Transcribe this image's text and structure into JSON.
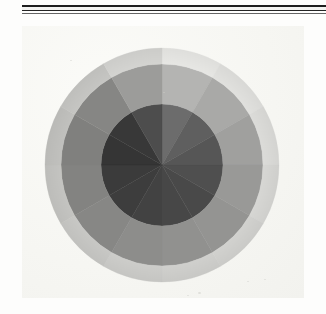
{
  "page": {
    "kind": "printed-plate",
    "background_color": "#fdfdfc",
    "paper_color": "#f5f5f1",
    "width": 326,
    "height": 314
  },
  "top_rule": {
    "name": "double-rule",
    "left": 22,
    "top": 5,
    "width": 304,
    "ink_color": "#1d1d1d",
    "line_count": 3
  },
  "plate": {
    "left": 22,
    "top": 26,
    "width": 282,
    "height": 272
  },
  "chart_data": {
    "type": "pie",
    "title": "",
    "subtitle": "",
    "xlabel": "",
    "ylabel": "",
    "legend_position": "none",
    "grid": false,
    "variant": "concentric-sector-wheel",
    "center": {
      "x": 162,
      "y": 165
    },
    "sector_count": 12,
    "sector_degrees": 30,
    "start_angle_deg": -90,
    "rings": [
      {
        "name": "inner",
        "inner_radius": 0,
        "outer_radius": 61
      },
      {
        "name": "middle",
        "inner_radius": 61,
        "outer_radius": 101
      },
      {
        "name": "outer",
        "inner_radius": 101,
        "outer_radius": 117
      }
    ],
    "categories": [
      "s1",
      "s2",
      "s3",
      "s4",
      "s5",
      "s6",
      "s7",
      "s8",
      "s9",
      "s10",
      "s11",
      "s12"
    ],
    "series": [
      {
        "name": "inner",
        "values": [
          62,
          58,
          52,
          48,
          45,
          43,
          40,
          36,
          34,
          30,
          33,
          46
        ],
        "colors": [
          "#6c6c6c",
          "#5e5e5e",
          "#565656",
          "#4f4f4f",
          "#4a4a4a",
          "#474747",
          "#434343",
          "#3c3c3c",
          "#3a3a3a",
          "#343434",
          "#383838",
          "#4d4d4d"
        ]
      },
      {
        "name": "middle",
        "values": [
          84,
          80,
          76,
          72,
          69,
          68,
          66,
          62,
          60,
          58,
          62,
          74
        ],
        "colors": [
          "#b4b4b2",
          "#a9a9a7",
          "#a0a09e",
          "#999997",
          "#949492",
          "#91918f",
          "#8d8d8b",
          "#878785",
          "#838381",
          "#80807e",
          "#868684",
          "#9c9c9a"
        ]
      },
      {
        "name": "outer",
        "values": [
          96,
          94,
          92,
          90,
          88,
          88,
          87,
          85,
          84,
          83,
          85,
          91
        ],
        "colors": [
          "#e7e7e4",
          "#e1e1de",
          "#dcdcd9",
          "#d7d7d4",
          "#d2d2cf",
          "#d0d0cd",
          "#cdcdca",
          "#c8c8c5",
          "#c4c4c1",
          "#c1c1be",
          "#c6c6c3",
          "#d4d4d1"
        ]
      }
    ]
  },
  "artifacts": {
    "specks": [
      {
        "x": 163,
        "y": 92,
        "size": 2
      },
      {
        "x": 187,
        "y": 295,
        "size": 2
      },
      {
        "x": 198,
        "y": 292,
        "size": 3
      },
      {
        "x": 247,
        "y": 281,
        "size": 2
      },
      {
        "x": 264,
        "y": 279,
        "size": 2
      },
      {
        "x": 70,
        "y": 60,
        "size": 2
      }
    ]
  }
}
